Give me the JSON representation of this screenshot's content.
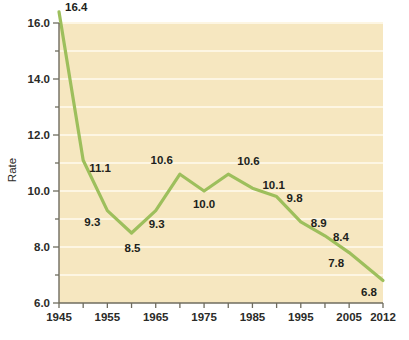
{
  "chart_data": {
    "type": "line",
    "title": "",
    "subtitle": "",
    "xlabel": "",
    "ylabel": "Rate",
    "x": [
      1945,
      1950,
      1955,
      1960,
      1965,
      1970,
      1975,
      1980,
      1985,
      1990,
      1995,
      2000,
      2005,
      2012
    ],
    "values": [
      16.4,
      11.1,
      9.3,
      8.5,
      9.3,
      10.6,
      10.0,
      10.6,
      10.1,
      9.8,
      8.9,
      8.4,
      7.8,
      6.8
    ],
    "point_labels": [
      "16.4",
      "11.1",
      "9.3",
      "8.5",
      "9.3",
      "10.6",
      "10.0",
      "10.6",
      "10.1",
      "9.8",
      "8.9",
      "8.4",
      "7.8",
      "6.8"
    ],
    "xlim": [
      1945,
      2012
    ],
    "ylim": [
      6.0,
      16.0
    ],
    "xticks": [
      1945,
      1950,
      1955,
      1960,
      1965,
      1970,
      1975,
      1980,
      1985,
      1990,
      1995,
      2000,
      2005,
      2012
    ],
    "xtick_labels": [
      "1945",
      "",
      "1955",
      "",
      "1965",
      "",
      "1975",
      "",
      "1985",
      "",
      "1995",
      "",
      "2005",
      "2012"
    ],
    "yticks": [
      6.0,
      7.0,
      8.0,
      9.0,
      10.0,
      11.0,
      12.0,
      13.0,
      14.0,
      15.0,
      16.0
    ],
    "ytick_labels": [
      "6.0",
      "",
      "8.0",
      "",
      "10.0",
      "",
      "12.0",
      "",
      "14.0",
      "",
      "16.0"
    ],
    "grid": true,
    "grid_orientation": "horizontal",
    "legend": false,
    "legend_position": "none",
    "series_color": "#9dbf5c",
    "plot_background": "#f6e7c0",
    "gridline_color": "#fdf6e3",
    "axis_color": "#8b8878",
    "page_background": "#ffffff"
  },
  "axis": {
    "y_title": "Rate",
    "y_labels": [
      "16.0",
      "14.0",
      "12.0",
      "10.0",
      "8.0",
      "6.0"
    ],
    "x_labels": [
      "1945",
      "1955",
      "1965",
      "1975",
      "1985",
      "1995",
      "2005",
      "2012"
    ]
  },
  "labels": {
    "p0": "16.4",
    "p1": "11.1",
    "p2": "9.3",
    "p3": "8.5",
    "p4": "9.3",
    "p5": "10.6",
    "p6": "10.0",
    "p7": "10.6",
    "p8": "10.1",
    "p9": "9.8",
    "p10": "8.9",
    "p11": "8.4",
    "p12": "7.8",
    "p13": "6.8"
  }
}
